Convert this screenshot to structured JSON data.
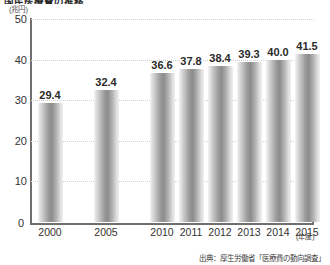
{
  "chart_data": {
    "type": "bar",
    "title": "国民医療費の推移",
    "unit_label": "(兆円)",
    "xlabel": "(年度)",
    "ylabel": "",
    "categories": [
      "2000",
      "2005",
      "2010",
      "2011",
      "2012",
      "2013",
      "2014",
      "2015"
    ],
    "values": [
      29.4,
      32.4,
      36.6,
      37.8,
      38.4,
      39.3,
      40.0,
      41.5
    ],
    "value_labels": [
      "29.4",
      "32.4",
      "36.6",
      "37.8",
      "38.4",
      "39.3",
      "40.0",
      "41.5"
    ],
    "ylim": [
      0,
      50
    ],
    "yticks": [
      0,
      10,
      20,
      30,
      40,
      50
    ],
    "ytick_labels": [
      "0",
      "10",
      "20",
      "30",
      "40",
      "50"
    ],
    "grid": true,
    "grid_axis": "y",
    "legend": null,
    "source_note": "出典：厚生労働省「医療費の動向調査」",
    "bar_color": "#9a9a9a",
    "axis_color": "#6f6f6f",
    "grid_color": "#cfcfcf",
    "text_color": "#333333"
  }
}
